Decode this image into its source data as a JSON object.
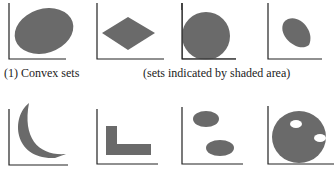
{
  "captions": {
    "convex": "(1) Convex sets",
    "note": "(sets indicated by shaded area)"
  },
  "colors": {
    "shape_fill": "#6a6a6a",
    "axis": "#222222",
    "background": "#ffffff"
  },
  "panels": {
    "convex": [
      {
        "name": "ellipse"
      },
      {
        "name": "rhombus"
      },
      {
        "name": "disk-touching-axes"
      },
      {
        "name": "lens"
      }
    ],
    "nonconvex": [
      {
        "name": "crescent"
      },
      {
        "name": "l-shape"
      },
      {
        "name": "two-separate-ellipses"
      },
      {
        "name": "disk-with-holes"
      }
    ]
  }
}
